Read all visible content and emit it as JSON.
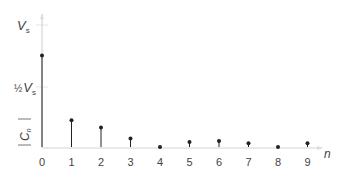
{
  "chart_data": {
    "type": "stem",
    "title": "",
    "xlabel": "n",
    "ylabel": "|Cn|",
    "y_ticks": [
      {
        "label": "Vs",
        "value": 1.0
      },
      {
        "label": "½Vs",
        "value": 0.5
      }
    ],
    "x": [
      0,
      1,
      2,
      3,
      4,
      5,
      6,
      7,
      8,
      9
    ],
    "values": [
      0.75,
      0.22,
      0.16,
      0.07,
      0.0,
      0.04,
      0.05,
      0.03,
      0.0,
      0.03
    ],
    "ylim": [
      0,
      1.1
    ],
    "grid": false,
    "units": "fraction of Vs"
  },
  "labels": {
    "vs": "V",
    "vs_sub": "s",
    "half": "½",
    "half_vs": "V",
    "half_vs_sub": "s",
    "ylabel_main": "C",
    "ylabel_sub": "n",
    "xlabel": "n",
    "ticks": [
      "0",
      "1",
      "2",
      "3",
      "4",
      "5",
      "6",
      "7",
      "8",
      "9"
    ]
  },
  "colors": {
    "stem": "#222222",
    "axis": "#cccccc",
    "text": "#444444"
  }
}
